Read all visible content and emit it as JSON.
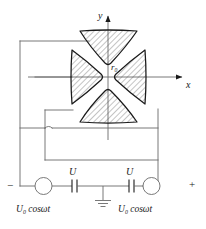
{
  "figure": {
    "axes": {
      "y_label": "y",
      "x_label": "x",
      "origin_gap_label": "r",
      "origin_gap_sub": "0"
    },
    "electrodes": [
      {
        "name": "top-electrode",
        "position": "top",
        "hatched": true
      },
      {
        "name": "bottom-electrode",
        "position": "bottom",
        "hatched": true
      },
      {
        "name": "left-electrode",
        "position": "left",
        "hatched": true
      },
      {
        "name": "right-electrode",
        "position": "right",
        "hatched": true
      }
    ],
    "circuit": {
      "left_source": {
        "label_main": "U",
        "label_sub": "0",
        "label_rest": " cosωt",
        "symbol": "ac-source-circle"
      },
      "right_source": {
        "label_main": "U",
        "label_sub": "0",
        "label_rest": " cosωt",
        "symbol": "ac-source-circle"
      },
      "left_capacitor": {
        "label": "U",
        "symbol": "capacitor"
      },
      "right_capacitor": {
        "label": "U",
        "symbol": "capacitor"
      },
      "ground": {
        "symbol": "ground-symbol"
      },
      "terminal_negative": "−",
      "terminal_positive": "+"
    },
    "colors": {
      "line": "#1a1a1a",
      "hatch": "#555555",
      "wire": "#666666",
      "background": "#ffffff"
    }
  }
}
